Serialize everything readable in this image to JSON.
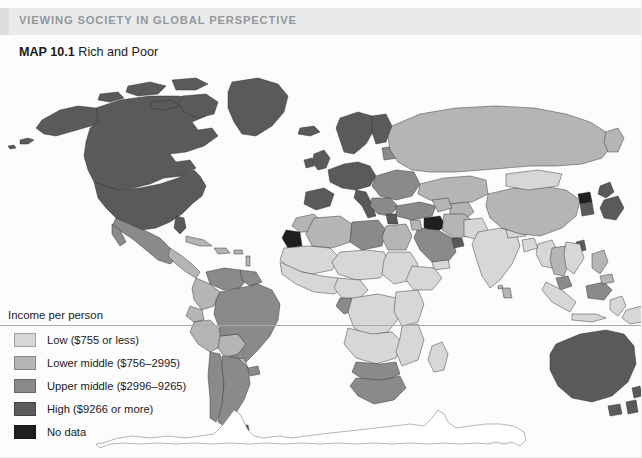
{
  "header": {
    "eyebrow": "VIEWING SOCIETY IN GLOBAL PERSPECTIVE",
    "band_color": "#e9eaeb",
    "text_color": "#93979b"
  },
  "map_title": {
    "number": "MAP 10.1",
    "name": "Rich and Poor"
  },
  "legend": {
    "heading": "Income per person",
    "items": [
      {
        "label": "Low ($755 or less)",
        "color": "#d7d7d7",
        "key": "low"
      },
      {
        "label": "Lower middle ($756–2995)",
        "color": "#b5b5b5",
        "key": "lower-middle"
      },
      {
        "label": "Upper middle ($2996–9265)",
        "color": "#8a8a8a",
        "key": "upper-middle"
      },
      {
        "label": "High ($9266 or more)",
        "color": "#5a5a5a",
        "key": "high"
      },
      {
        "label": "No data",
        "color": "#1f1f1f",
        "key": "no-data"
      }
    ]
  },
  "map": {
    "projection_note": "world equirectangular",
    "ocean_color": "#fcfcfc",
    "border_color": "#2b2b2b",
    "antarctica_fill": "#ffffff",
    "equator_rule_color": "#a9a9a9",
    "regions": [
      {
        "name": "Canada",
        "category": "high"
      },
      {
        "name": "United States",
        "category": "high"
      },
      {
        "name": "Greenland",
        "category": "high"
      },
      {
        "name": "Mexico",
        "category": "upper-middle"
      },
      {
        "name": "Central America",
        "category": "lower-middle"
      },
      {
        "name": "Caribbean",
        "category": "lower-middle"
      },
      {
        "name": "Venezuela",
        "category": "upper-middle"
      },
      {
        "name": "Colombia",
        "category": "lower-middle"
      },
      {
        "name": "Ecuador",
        "category": "lower-middle"
      },
      {
        "name": "Peru",
        "category": "lower-middle"
      },
      {
        "name": "Bolivia",
        "category": "lower-middle"
      },
      {
        "name": "Brazil",
        "category": "upper-middle"
      },
      {
        "name": "Argentina",
        "category": "upper-middle"
      },
      {
        "name": "Chile",
        "category": "upper-middle"
      },
      {
        "name": "Uruguay",
        "category": "upper-middle"
      },
      {
        "name": "Paraguay",
        "category": "lower-middle"
      },
      {
        "name": "Guyanas",
        "category": "upper-middle"
      },
      {
        "name": "Western Europe",
        "category": "high"
      },
      {
        "name": "United Kingdom",
        "category": "high"
      },
      {
        "name": "Iceland",
        "category": "high"
      },
      {
        "name": "Scandinavia",
        "category": "high"
      },
      {
        "name": "Eastern Europe",
        "category": "upper-middle"
      },
      {
        "name": "Russia",
        "category": "lower-middle"
      },
      {
        "name": "Central Asia",
        "category": "lower-middle"
      },
      {
        "name": "Turkey",
        "category": "upper-middle"
      },
      {
        "name": "Saudi Arabia",
        "category": "upper-middle"
      },
      {
        "name": "Gulf States",
        "category": "high"
      },
      {
        "name": "Iran",
        "category": "lower-middle"
      },
      {
        "name": "Iraq",
        "category": "no-data"
      },
      {
        "name": "Morocco",
        "category": "lower-middle"
      },
      {
        "name": "Western Sahara",
        "category": "no-data"
      },
      {
        "name": "Algeria",
        "category": "lower-middle"
      },
      {
        "name": "Libya",
        "category": "upper-middle"
      },
      {
        "name": "Egypt",
        "category": "lower-middle"
      },
      {
        "name": "Sahel and West Africa",
        "category": "low"
      },
      {
        "name": "Central Africa",
        "category": "low"
      },
      {
        "name": "Gabon",
        "category": "upper-middle"
      },
      {
        "name": "East Africa",
        "category": "low"
      },
      {
        "name": "Southern Africa",
        "category": "low"
      },
      {
        "name": "Botswana",
        "category": "upper-middle"
      },
      {
        "name": "South Africa",
        "category": "upper-middle"
      },
      {
        "name": "Madagascar",
        "category": "low"
      },
      {
        "name": "India",
        "category": "low"
      },
      {
        "name": "Pakistan",
        "category": "low"
      },
      {
        "name": "Bangladesh",
        "category": "low"
      },
      {
        "name": "China",
        "category": "lower-middle"
      },
      {
        "name": "Mongolia",
        "category": "low"
      },
      {
        "name": "Japan",
        "category": "high"
      },
      {
        "name": "South Korea",
        "category": "high"
      },
      {
        "name": "North Korea",
        "category": "no-data"
      },
      {
        "name": "Thailand",
        "category": "lower-middle"
      },
      {
        "name": "Vietnam",
        "category": "low"
      },
      {
        "name": "Malaysia",
        "category": "upper-middle"
      },
      {
        "name": "Indonesia",
        "category": "low"
      },
      {
        "name": "Philippines",
        "category": "lower-middle"
      },
      {
        "name": "Papua New Guinea",
        "category": "low"
      },
      {
        "name": "Australia",
        "category": "high"
      },
      {
        "name": "New Zealand",
        "category": "high"
      },
      {
        "name": "Antarctica",
        "category": "no-fill"
      }
    ]
  }
}
